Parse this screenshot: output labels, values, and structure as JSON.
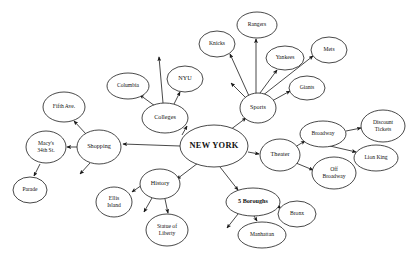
{
  "diagram": {
    "title": "NEW YORK",
    "type": "mind-map",
    "canvas": {
      "width": 414,
      "height": 262
    },
    "stroke_color": "#1a1a1a",
    "text_color": "#111111",
    "background_color": "#ffffff"
  },
  "nodes": [
    {
      "id": "new-york",
      "label": "NEW YORK",
      "lines": [
        "NEW YORK"
      ],
      "cx": 214,
      "cy": 146,
      "rx": 34,
      "ry": 21,
      "size": "lg",
      "bold": true
    },
    {
      "id": "sports",
      "label": "Sports",
      "lines": [
        "Sports"
      ],
      "cx": 258,
      "cy": 108,
      "rx": 18,
      "ry": 15,
      "size": "md",
      "bold": false
    },
    {
      "id": "rangers",
      "label": "Rangers",
      "lines": [
        "Rangers"
      ],
      "cx": 257,
      "cy": 25,
      "rx": 20,
      "ry": 13,
      "size": "sm",
      "bold": false
    },
    {
      "id": "knicks",
      "label": "Knicks",
      "lines": [
        "Knicks"
      ],
      "cx": 217,
      "cy": 44,
      "rx": 18,
      "ry": 13,
      "size": "sm",
      "bold": false
    },
    {
      "id": "yankees",
      "label": "Yankees",
      "lines": [
        "Yankees"
      ],
      "cx": 285,
      "cy": 58,
      "rx": 19,
      "ry": 12,
      "size": "sm",
      "bold": false
    },
    {
      "id": "mets",
      "label": "Mets",
      "lines": [
        "Mets"
      ],
      "cx": 329,
      "cy": 50,
      "rx": 18,
      "ry": 13,
      "size": "sm",
      "bold": false
    },
    {
      "id": "giants",
      "label": "Giants",
      "lines": [
        "Giants"
      ],
      "cx": 307,
      "cy": 88,
      "rx": 18,
      "ry": 12,
      "size": "sm",
      "bold": false
    },
    {
      "id": "colleges",
      "label": "Colleges",
      "lines": [
        "Colleges"
      ],
      "cx": 165,
      "cy": 118,
      "rx": 23,
      "ry": 15,
      "size": "md",
      "bold": false
    },
    {
      "id": "columbia",
      "label": "Columbia",
      "lines": [
        "Columbia"
      ],
      "cx": 128,
      "cy": 86,
      "rx": 21,
      "ry": 13,
      "size": "sm",
      "bold": false
    },
    {
      "id": "nyu",
      "label": "NYU",
      "lines": [
        "NYU"
      ],
      "cx": 185,
      "cy": 79,
      "rx": 18,
      "ry": 13,
      "size": "md",
      "bold": false
    },
    {
      "id": "shopping",
      "label": "Shopping",
      "lines": [
        "Shopping"
      ],
      "cx": 99,
      "cy": 147,
      "rx": 22,
      "ry": 17,
      "size": "md",
      "bold": false
    },
    {
      "id": "fifth-ave",
      "label": "Fifth Ave.",
      "lines": [
        "Fifth Ave."
      ],
      "cx": 64,
      "cy": 107,
      "rx": 21,
      "ry": 15,
      "size": "sm",
      "bold": false
    },
    {
      "id": "macys-34th-st",
      "label": "Macy's 34th St",
      "lines": [
        "Macy's",
        "34th St."
      ],
      "cx": 46,
      "cy": 147,
      "rx": 20,
      "ry": 16,
      "size": "sm",
      "bold": false
    },
    {
      "id": "parade",
      "label": "Parade",
      "lines": [
        "Parade"
      ],
      "cx": 30,
      "cy": 190,
      "rx": 17,
      "ry": 13,
      "size": "sm",
      "bold": false
    },
    {
      "id": "history",
      "label": "History",
      "lines": [
        "History"
      ],
      "cx": 160,
      "cy": 184,
      "rx": 20,
      "ry": 15,
      "size": "md",
      "bold": false
    },
    {
      "id": "ellis-island",
      "label": "Ellis Island",
      "lines": [
        "Ellis",
        "Island"
      ],
      "cx": 114,
      "cy": 202,
      "rx": 18,
      "ry": 15,
      "size": "sm",
      "bold": false
    },
    {
      "id": "statue-of-liberty",
      "label": "Statue of Liberty",
      "lines": [
        "Statue of",
        "Liberty"
      ],
      "cx": 167,
      "cy": 230,
      "rx": 21,
      "ry": 16,
      "size": "sm",
      "bold": false
    },
    {
      "id": "5-boroughs",
      "label": "5 Boroughs",
      "lines": [
        "5 Boroughs"
      ],
      "cx": 253,
      "cy": 202,
      "rx": 27,
      "ry": 14,
      "size": "md",
      "bold": true
    },
    {
      "id": "manhattan",
      "label": "Manhattan",
      "lines": [
        "Manhattan"
      ],
      "cx": 262,
      "cy": 235,
      "rx": 24,
      "ry": 13,
      "size": "sm",
      "bold": false
    },
    {
      "id": "bronx",
      "label": "Bronx",
      "lines": [
        "Bronx"
      ],
      "cx": 297,
      "cy": 214,
      "rx": 19,
      "ry": 13,
      "size": "sm",
      "bold": false
    },
    {
      "id": "theater",
      "label": "Theater",
      "lines": [
        "Theater"
      ],
      "cx": 280,
      "cy": 155,
      "rx": 20,
      "ry": 16,
      "size": "md",
      "bold": false
    },
    {
      "id": "broadway",
      "label": "Broadway",
      "lines": [
        "Broadway"
      ],
      "cx": 323,
      "cy": 134,
      "rx": 23,
      "ry": 13,
      "size": "sm",
      "bold": false
    },
    {
      "id": "discount-tickets",
      "label": "Discount Tickets",
      "lines": [
        "Discount",
        "Tickets"
      ],
      "cx": 383,
      "cy": 126,
      "rx": 22,
      "ry": 16,
      "size": "sm",
      "bold": false
    },
    {
      "id": "lion-king",
      "label": "Lion King",
      "lines": [
        "Lion King"
      ],
      "cx": 376,
      "cy": 158,
      "rx": 22,
      "ry": 13,
      "size": "sm",
      "bold": false
    },
    {
      "id": "off-broadway",
      "label": "Off Broadway",
      "lines": [
        "Off",
        "Broadway"
      ],
      "cx": 334,
      "cy": 173,
      "rx": 22,
      "ry": 16,
      "size": "sm",
      "bold": false
    }
  ],
  "edges": [
    {
      "from": "new-york",
      "to": "sports",
      "x1": 230,
      "y1": 130,
      "x2": 246,
      "y2": 118
    },
    {
      "from": "new-york",
      "to": "colleges",
      "x1": 182,
      "y1": 135,
      "x2": 187,
      "y2": 126
    },
    {
      "from": "new-york",
      "to": "shopping",
      "x1": 180,
      "y1": 146,
      "x2": 123,
      "y2": 144
    },
    {
      "from": "new-york",
      "to": "history",
      "x1": 198,
      "y1": 163,
      "x2": 177,
      "y2": 179
    },
    {
      "from": "new-york",
      "to": "5-boroughs",
      "x1": 220,
      "y1": 167,
      "x2": 238,
      "y2": 190
    },
    {
      "from": "new-york",
      "to": "theater",
      "x1": 248,
      "y1": 152,
      "x2": 259,
      "y2": 154
    },
    {
      "from": "sports",
      "to": "knicks",
      "x1": 249,
      "y1": 96,
      "x2": 230,
      "y2": 54
    },
    {
      "from": "sports",
      "to": "rangers",
      "x1": 256,
      "y1": 93,
      "x2": 256,
      "y2": 39
    },
    {
      "from": "sports",
      "to": "yankees",
      "x1": 260,
      "y1": 93,
      "x2": 277,
      "y2": 70
    },
    {
      "from": "sports",
      "to": "mets",
      "x1": 262,
      "y1": 96,
      "x2": 313,
      "y2": 56
    },
    {
      "from": "sports",
      "to": "giants",
      "x1": 272,
      "y1": 101,
      "x2": 290,
      "y2": 91
    },
    {
      "from": "sports",
      "to": "stub-left",
      "x1": 246,
      "y1": 98,
      "x2": 231,
      "y2": 83
    },
    {
      "from": "colleges",
      "to": "columbia",
      "x1": 155,
      "y1": 106,
      "x2": 140,
      "y2": 95
    },
    {
      "from": "colleges",
      "to": "nyu",
      "x1": 174,
      "y1": 104,
      "x2": 180,
      "y2": 92
    },
    {
      "from": "colleges",
      "to": "stub-up",
      "x1": 163,
      "y1": 103,
      "x2": 159,
      "y2": 57
    },
    {
      "from": "shopping",
      "to": "fifth-ave",
      "x1": 86,
      "y1": 134,
      "x2": 74,
      "y2": 121
    },
    {
      "from": "shopping",
      "to": "macys-34th-st",
      "x1": 77,
      "y1": 147,
      "x2": 67,
      "y2": 147
    },
    {
      "from": "shopping",
      "to": "stub-down",
      "x1": 90,
      "y1": 163,
      "x2": 80,
      "y2": 174
    },
    {
      "from": "macys-34th-st",
      "to": "parade",
      "x1": 40,
      "y1": 164,
      "x2": 34,
      "y2": 176
    },
    {
      "from": "history",
      "to": "ellis-island",
      "x1": 142,
      "y1": 185,
      "x2": 132,
      "y2": 192
    },
    {
      "from": "history",
      "to": "statue-of-liberty",
      "x1": 165,
      "y1": 199,
      "x2": 168,
      "y2": 213
    },
    {
      "from": "history",
      "to": "stub-down",
      "x1": 152,
      "y1": 198,
      "x2": 144,
      "y2": 212
    },
    {
      "from": "5-boroughs",
      "to": "manhattan",
      "x1": 254,
      "y1": 216,
      "x2": 257,
      "y2": 221
    },
    {
      "from": "5-boroughs",
      "to": "bronx",
      "x1": 277,
      "y1": 205,
      "x2": 281,
      "y2": 209
    },
    {
      "from": "5-boroughs",
      "to": "stub-down",
      "x1": 238,
      "y1": 214,
      "x2": 227,
      "y2": 228
    },
    {
      "from": "theater",
      "to": "broadway",
      "x1": 295,
      "y1": 147,
      "x2": 305,
      "y2": 141
    },
    {
      "from": "theater",
      "to": "off-broadway",
      "x1": 296,
      "y1": 163,
      "x2": 313,
      "y2": 170
    },
    {
      "from": "broadway",
      "to": "discount-tickets",
      "x1": 346,
      "y1": 131,
      "x2": 361,
      "y2": 128
    },
    {
      "from": "broadway",
      "to": "lion-king",
      "x1": 330,
      "y1": 146,
      "x2": 356,
      "y2": 152
    }
  ]
}
